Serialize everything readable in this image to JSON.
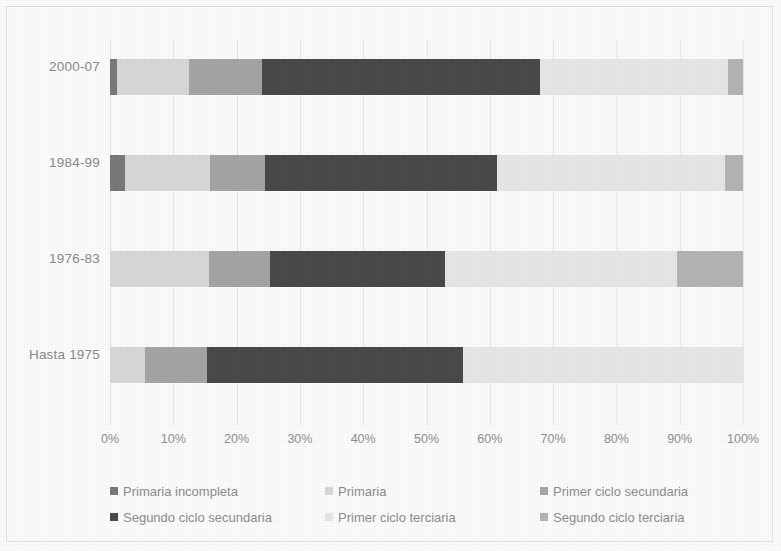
{
  "chart_data": {
    "type": "bar",
    "orientation": "horizontal",
    "stacked": true,
    "normalized": "100%",
    "title": "",
    "subtitle": "",
    "xlabel": "",
    "ylabel": "",
    "xlim": [
      0,
      100
    ],
    "grid": true,
    "legend_position": "bottom",
    "tick_labels": [
      "0%",
      "10%",
      "20%",
      "30%",
      "40%",
      "50%",
      "60%",
      "70%",
      "80%",
      "90%",
      "100%"
    ],
    "tick_values": [
      0,
      10,
      20,
      30,
      40,
      50,
      60,
      70,
      80,
      90,
      100
    ],
    "categories": [
      "2000-07",
      "1984-99",
      "1976-83",
      "Hasta 1975"
    ],
    "series": [
      {
        "name": "Primaria incompleta",
        "color": "#7a7a7a",
        "values": [
          1.1,
          2.4,
          0.0,
          0.0
        ]
      },
      {
        "name": "Primaria",
        "color": "#d9d9d9",
        "values": [
          11.4,
          13.4,
          15.6,
          5.5
        ]
      },
      {
        "name": "Primer ciclo secundaria",
        "color": "#a6a6a6",
        "values": [
          11.5,
          8.7,
          9.6,
          9.8
        ]
      },
      {
        "name": "Segundo ciclo secundaria",
        "color": "#4a4a4a",
        "values": [
          43.9,
          36.6,
          27.7,
          40.5
        ]
      },
      {
        "name": "Primer ciclo terciaria",
        "color": "#e8e8e8",
        "values": [
          29.8,
          36.1,
          36.6,
          44.2
        ]
      },
      {
        "name": "Segundo ciclo terciaria",
        "color": "#b5b5b5",
        "values": [
          2.3,
          2.8,
          10.5,
          0.0
        ]
      }
    ]
  },
  "axis": {
    "x_tick_labels": [
      "0%",
      "10%",
      "20%",
      "30%",
      "40%",
      "50%",
      "60%",
      "70%",
      "80%",
      "90%",
      "100%"
    ],
    "y_tick_labels": [
      "2000-07",
      "1984-99",
      "1976-83",
      "Hasta 1975"
    ]
  },
  "legend": {
    "items": [
      {
        "label": "Primaria incompleta",
        "color": "#7a7a7a"
      },
      {
        "label": "Primaria",
        "color": "#d9d9d9"
      },
      {
        "label": "Primer ciclo secundaria",
        "color": "#a6a6a6"
      },
      {
        "label": "Segundo ciclo secundaria",
        "color": "#4a4a4a"
      },
      {
        "label": "Primer ciclo terciaria",
        "color": "#e8e8e8"
      },
      {
        "label": "Segundo ciclo terciaria",
        "color": "#b5b5b5"
      }
    ]
  },
  "colors": {
    "background": "#fdfdfd",
    "gridline": "#e9e9e9",
    "tick_text": "#8f8f8f",
    "legend_text": "#8d8d8d"
  }
}
